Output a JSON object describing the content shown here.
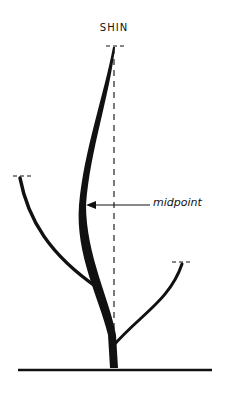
{
  "diagram": {
    "title": "SHIN",
    "annotation": "midpoint",
    "colors": {
      "ink": "#111111",
      "background": "#ffffff"
    },
    "elements": [
      "main-stem",
      "left-branch",
      "right-branch",
      "vertical-dashed-reference",
      "ground-line",
      "midpoint-arrow"
    ]
  }
}
